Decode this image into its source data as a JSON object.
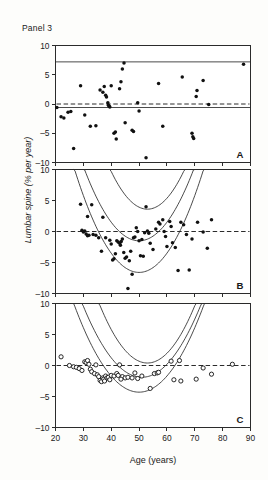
{
  "figure": {
    "title": "Panel 3",
    "ylabel": "Lumbar spine (% per year)",
    "xlabel": "Age (years)"
  },
  "axis": {
    "x_ticks": [
      "20",
      "30",
      "40",
      "50",
      "60",
      "70",
      "80",
      "90"
    ],
    "y_ticks": [
      "10",
      "5",
      "0",
      "-5",
      "-10"
    ],
    "panel_letters": [
      "A",
      "B",
      "C"
    ]
  },
  "chart_data": {
    "type": "scatter",
    "title": "Panel 3",
    "xlabel": "Age (years)",
    "ylabel": "Lumbar spine (% per year)",
    "xlim": [
      20,
      90
    ],
    "ylim": [
      -10,
      10
    ],
    "xticks": [
      20,
      30,
      40,
      50,
      60,
      70,
      80,
      90
    ],
    "yticks": [
      -10,
      -5,
      0,
      5,
      10
    ],
    "grid": false,
    "legend": "none",
    "panels": [
      {
        "letter": "A",
        "marker": "filled-circle",
        "reference_line": {
          "type": "dashed-horizontal",
          "y": 0
        },
        "bands": [
          {
            "name": "upper-limit",
            "type": "horizontal",
            "y": 7.2
          },
          {
            "name": "lower-limit",
            "type": "horizontal",
            "y": -0.6
          }
        ],
        "points": [
          [
            20.5,
            -0.6
          ],
          [
            22.0,
            -2.2
          ],
          [
            23.0,
            -2.4
          ],
          [
            24.5,
            -1.4
          ],
          [
            25.5,
            -1.3
          ],
          [
            26.5,
            -7.6
          ],
          [
            29.0,
            3.1
          ],
          [
            30.5,
            -1.9
          ],
          [
            32.5,
            -3.8
          ],
          [
            34.5,
            -3.7
          ],
          [
            36.0,
            2.4
          ],
          [
            37.0,
            2.0
          ],
          [
            37.5,
            3.0
          ],
          [
            38.0,
            1.5
          ],
          [
            38.3,
            1.2
          ],
          [
            38.8,
            0.2
          ],
          [
            39.0,
            -0.2
          ],
          [
            39.3,
            -0.4
          ],
          [
            39.5,
            -0.5
          ],
          [
            40.0,
            3.1
          ],
          [
            41.0,
            -5.0
          ],
          [
            41.5,
            -4.8
          ],
          [
            41.8,
            -6.0
          ],
          [
            43.0,
            2.6
          ],
          [
            43.5,
            3.8
          ],
          [
            44.0,
            6.0
          ],
          [
            44.6,
            7.0
          ],
          [
            45.0,
            -3.2
          ],
          [
            47.5,
            -4.5
          ],
          [
            48.0,
            -4.7
          ],
          [
            49.5,
            0.2
          ],
          [
            50.0,
            -1.2
          ],
          [
            52.5,
            -9.2
          ],
          [
            57.0,
            3.5
          ],
          [
            58.5,
            -3.8
          ],
          [
            65.5,
            4.6
          ],
          [
            69.0,
            -5.0
          ],
          [
            69.3,
            -5.6
          ],
          [
            69.6,
            -5.9
          ],
          [
            70.5,
            1.3
          ],
          [
            70.8,
            2.3
          ],
          [
            73.0,
            4.0
          ],
          [
            75.0,
            -0.1
          ],
          [
            87.5,
            6.8
          ]
        ]
      },
      {
        "letter": "B",
        "marker": "filled-circle",
        "reference_line": {
          "type": "dashed-horizontal",
          "y": 0
        },
        "bands": [
          {
            "name": "upper-outer",
            "type": "quadratic",
            "vertex_age": 53,
            "vertex_y": 3.6,
            "curvature": 0.0036
          },
          {
            "name": "center-fit",
            "type": "quadratic",
            "vertex_age": 50,
            "vertex_y": -1.5,
            "curvature": 0.003
          },
          {
            "name": "lower-outer",
            "type": "quadratic",
            "vertex_age": 50,
            "vertex_y": -6.6,
            "curvature": 0.0031
          }
        ],
        "points": [
          [
            29.0,
            4.4
          ],
          [
            31.5,
            2.4
          ],
          [
            33.0,
            4.3
          ],
          [
            29.5,
            0.2
          ],
          [
            30.0,
            -0.1
          ],
          [
            30.5,
            0.1
          ],
          [
            31.0,
            -0.4
          ],
          [
            31.5,
            -0.7
          ],
          [
            32.0,
            -0.6
          ],
          [
            33.5,
            -0.5
          ],
          [
            34.5,
            -0.6
          ],
          [
            36.5,
            -3.2
          ],
          [
            38.0,
            -1.0
          ],
          [
            39.5,
            -1.4
          ],
          [
            40.0,
            -2.0
          ],
          [
            40.5,
            -4.6
          ],
          [
            41.0,
            -4.4
          ],
          [
            41.5,
            -3.6
          ],
          [
            42.0,
            -1.5
          ],
          [
            42.5,
            -1.7
          ],
          [
            43.0,
            -1.9
          ],
          [
            43.3,
            -2.2
          ],
          [
            43.6,
            -1.6
          ],
          [
            44.0,
            -1.2
          ],
          [
            44.5,
            -3.4
          ],
          [
            45.0,
            -4.3
          ],
          [
            45.5,
            -4.1
          ],
          [
            46.0,
            -9.2
          ],
          [
            47.0,
            -3.2
          ],
          [
            47.5,
            -6.9
          ],
          [
            48.0,
            -1.0
          ],
          [
            48.5,
            -0.9
          ],
          [
            49.0,
            0.6
          ],
          [
            49.5,
            0.0
          ],
          [
            50.0,
            -1.5
          ],
          [
            51.0,
            -1.3
          ],
          [
            52.0,
            -0.2
          ],
          [
            52.5,
            4.0
          ],
          [
            53.0,
            0.1
          ],
          [
            53.5,
            -0.3
          ],
          [
            54.0,
            -1.9
          ],
          [
            55.0,
            -2.9
          ],
          [
            56.0,
            0.4
          ],
          [
            57.0,
            1.5
          ],
          [
            57.5,
            1.2
          ],
          [
            58.5,
            1.9
          ],
          [
            59.0,
            0.0
          ],
          [
            59.5,
            -0.8
          ],
          [
            60.0,
            -2.4
          ],
          [
            61.0,
            1.6
          ],
          [
            61.5,
            0.8
          ],
          [
            62.0,
            -1.8
          ],
          [
            63.0,
            -2.6
          ],
          [
            64.0,
            -6.3
          ],
          [
            65.0,
            1.5
          ],
          [
            66.0,
            1.1
          ],
          [
            67.0,
            -0.5
          ],
          [
            68.0,
            -6.2
          ],
          [
            69.0,
            -1.2
          ],
          [
            71.0,
            1.5
          ],
          [
            73.0,
            -0.1
          ],
          [
            74.5,
            -2.7
          ],
          [
            76.0,
            1.9
          ],
          [
            37.0,
            2.3
          ],
          [
            35.5,
            -1.0
          ],
          [
            50.5,
            -3.9
          ],
          [
            51.5,
            -4.0
          ],
          [
            46.5,
            -4.7
          ]
        ]
      },
      {
        "letter": "C",
        "marker": "open-circle",
        "reference_line": {
          "type": "dashed-horizontal",
          "y": 0
        },
        "bands": [
          {
            "name": "upper-outer",
            "type": "quadratic",
            "vertex_age": 53,
            "vertex_y": 0.4,
            "curvature": 0.0032
          },
          {
            "name": "center-fit",
            "type": "quadratic",
            "vertex_age": 51,
            "vertex_y": -1.9,
            "curvature": 0.0026
          },
          {
            "name": "lower-outer",
            "type": "quadratic",
            "vertex_age": 50,
            "vertex_y": -4.3,
            "curvature": 0.0026
          }
        ],
        "points": [
          [
            22.0,
            1.4
          ],
          [
            25.0,
            0.0
          ],
          [
            26.5,
            -0.2
          ],
          [
            27.5,
            -0.3
          ],
          [
            28.5,
            -0.5
          ],
          [
            29.5,
            -0.8
          ],
          [
            30.5,
            0.6
          ],
          [
            31.0,
            0.5
          ],
          [
            31.5,
            0.8
          ],
          [
            32.0,
            0.2
          ],
          [
            32.5,
            -0.6
          ],
          [
            33.0,
            -1.0
          ],
          [
            34.0,
            -1.3
          ],
          [
            35.0,
            -1.5
          ],
          [
            35.5,
            -1.8
          ],
          [
            36.0,
            -2.4
          ],
          [
            36.5,
            -2.6
          ],
          [
            37.0,
            -2.0
          ],
          [
            37.3,
            -2.2
          ],
          [
            37.6,
            -2.5
          ],
          [
            38.0,
            -1.7
          ],
          [
            38.5,
            -2.0
          ],
          [
            39.0,
            -1.9
          ],
          [
            39.5,
            -2.3
          ],
          [
            40.0,
            -1.6
          ],
          [
            41.0,
            -1.7
          ],
          [
            42.0,
            -1.3
          ],
          [
            42.5,
            -1.6
          ],
          [
            43.0,
            0.1
          ],
          [
            44.0,
            -1.8
          ],
          [
            45.0,
            -2.0
          ],
          [
            46.0,
            -1.9
          ],
          [
            47.5,
            -2.0
          ],
          [
            48.5,
            -1.2
          ],
          [
            49.5,
            -2.1
          ],
          [
            51.0,
            -1.7
          ],
          [
            54.0,
            -3.7
          ],
          [
            55.5,
            -1.3
          ],
          [
            56.5,
            -1.2
          ],
          [
            57.0,
            -1.1
          ],
          [
            61.5,
            0.7
          ],
          [
            62.5,
            -2.3
          ],
          [
            64.5,
            0.8
          ],
          [
            65.0,
            -2.5
          ],
          [
            70.5,
            -2.2
          ],
          [
            73.0,
            -0.4
          ],
          [
            76.0,
            -1.4
          ],
          [
            83.5,
            0.2
          ],
          [
            34.5,
            0.1
          ],
          [
            43.5,
            -2.2
          ]
        ]
      }
    ]
  }
}
